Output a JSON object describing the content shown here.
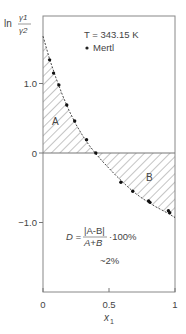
{
  "chart_data": {
    "type": "line",
    "title": "",
    "xlabel": "x1",
    "ylabel": "ln(γ1/γ2)",
    "xlim": [
      0,
      1
    ],
    "ylim": [
      -2.0,
      2.0
    ],
    "grid": false,
    "x_ticks": [
      {
        "value": 0,
        "label": "0"
      },
      {
        "value": 0.5,
        "label": "0.5"
      },
      {
        "value": 1,
        "label": "1"
      }
    ],
    "y_ticks": [
      {
        "value": 1.0,
        "label": "1.0"
      },
      {
        "value": 0,
        "label": "0"
      },
      {
        "value": -1.0,
        "label": "−1.0"
      }
    ],
    "series": [
      {
        "name": "Fitted curve",
        "style": "dashed",
        "x": [
          0.0,
          0.05,
          0.1,
          0.15,
          0.2,
          0.25,
          0.3,
          0.35,
          0.4,
          0.45,
          0.5,
          0.55,
          0.6,
          0.65,
          0.7,
          0.75,
          0.8,
          0.85,
          0.9,
          0.95,
          1.0
        ],
        "y": [
          1.68,
          1.35,
          1.07,
          0.82,
          0.6,
          0.41,
          0.25,
          0.11,
          -0.01,
          -0.12,
          -0.22,
          -0.32,
          -0.41,
          -0.5,
          -0.58,
          -0.65,
          -0.71,
          -0.77,
          -0.82,
          -0.87,
          -0.93
        ]
      },
      {
        "name": "Mertl",
        "style": "markers",
        "x": [
          0.05,
          0.08,
          0.12,
          0.18,
          0.24,
          0.33,
          0.4,
          0.59,
          0.68,
          0.8,
          0.81,
          0.95,
          0.96
        ],
        "y": [
          1.34,
          1.15,
          0.98,
          0.69,
          0.46,
          0.19,
          0.0,
          -0.42,
          -0.55,
          -0.69,
          -0.71,
          -0.83,
          -0.86
        ]
      }
    ],
    "regions": [
      {
        "label": "A",
        "description": "hatched area above zero between curve and x-axis"
      },
      {
        "label": "B",
        "description": "hatched area below zero between curve and x-axis"
      }
    ],
    "annotations": {
      "temperature": "T = 343.15 K",
      "legend_marker": "Mertl",
      "formula_lhs": "D =",
      "formula_num": "|A-B|",
      "formula_den": "A+B",
      "formula_rhs": "·100%",
      "result": "~2%"
    },
    "legend_position": "top-right"
  },
  "labels": {
    "y_axis_ln": "ln",
    "y_axis_num": "γ1",
    "y_axis_den": "γ2",
    "x_axis_main": "x",
    "x_axis_sub": "1",
    "region_a": "A",
    "region_b": "B"
  }
}
